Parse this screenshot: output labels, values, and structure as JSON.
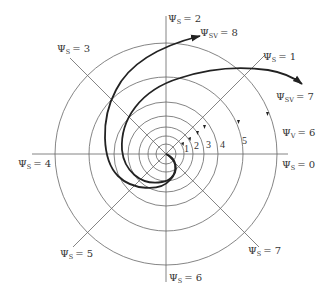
{
  "diagram": {
    "center": {
      "x": 166,
      "y": 154
    },
    "circle_radii": [
      10,
      18,
      27,
      38,
      52,
      77,
      111
    ],
    "colors": {
      "grid": "#666666",
      "curve": "#222222",
      "text": "#333333",
      "background": "#ffffff"
    },
    "spoke_labels": [
      {
        "id": "s0",
        "psi": "Ψ",
        "sub": "S",
        "value": "= 0",
        "angle_deg": 0
      },
      {
        "id": "s1",
        "psi": "Ψ",
        "sub": "S",
        "value": "= 1",
        "angle_deg": 45
      },
      {
        "id": "s2",
        "psi": "Ψ",
        "sub": "S",
        "value": "= 2",
        "angle_deg": 90
      },
      {
        "id": "s3",
        "psi": "Ψ",
        "sub": "S",
        "value": "= 3",
        "angle_deg": 135
      },
      {
        "id": "s4",
        "psi": "Ψ",
        "sub": "S",
        "value": "= 4",
        "angle_deg": 180
      },
      {
        "id": "s5",
        "psi": "Ψ",
        "sub": "S",
        "value": "= 5",
        "angle_deg": 225
      },
      {
        "id": "s6",
        "psi": "Ψ",
        "sub": "S",
        "value": "= 6",
        "angle_deg": 270
      },
      {
        "id": "s7",
        "psi": "Ψ",
        "sub": "S",
        "value": "= 7",
        "angle_deg": 315
      }
    ],
    "curve_labels": [
      {
        "id": "sv8",
        "psi": "Ψ",
        "sub": "SV",
        "value": "= 8"
      },
      {
        "id": "sv7",
        "psi": "Ψ",
        "sub": "SV",
        "value": "= 7"
      },
      {
        "id": "v6",
        "psi": "Ψ",
        "sub": "V",
        "value": "= 6"
      }
    ],
    "circle_numbers": [
      "1",
      "2",
      "3",
      "4",
      "5"
    ]
  }
}
